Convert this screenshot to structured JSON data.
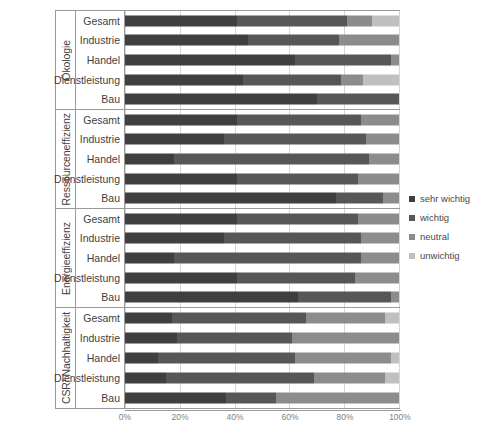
{
  "chart_data": {
    "type": "bar",
    "subtype": "stacked-horizontal-100-percent",
    "title": "",
    "xlabel": "",
    "ylabel": "",
    "xlim": [
      0,
      100
    ],
    "xticks": [
      "0%",
      "20%",
      "40%",
      "60%",
      "80%",
      "100%"
    ],
    "xtick_values": [
      0,
      20,
      40,
      60,
      80,
      100
    ],
    "grid": true,
    "legend_position": "right",
    "categories": [
      "Gesamt",
      "Industrie",
      "Handel",
      "Dienstleistung",
      "Bau"
    ],
    "series": [
      {
        "name": "sehr wichtig",
        "color": "#3f3f3f"
      },
      {
        "name": "wichtig",
        "color": "#575757"
      },
      {
        "name": "neutral",
        "color": "#8c8c8c"
      },
      {
        "name": "unwichtig",
        "color": "#c0c0c0"
      }
    ],
    "groups": [
      {
        "label": "Ökologie",
        "rows": [
          {
            "category": "Gesamt",
            "values": [
              41,
              40,
              9,
              10
            ]
          },
          {
            "category": "Industrie",
            "values": [
              45,
              33,
              22,
              0
            ]
          },
          {
            "category": "Handel",
            "values": [
              62,
              35,
              3,
              0
            ]
          },
          {
            "category": "Dienstleistung",
            "values": [
              43,
              36,
              8,
              13
            ]
          },
          {
            "category": "Bau",
            "values": [
              70,
              30,
              0,
              0
            ]
          }
        ]
      },
      {
        "label": "Ressourceneffizienz",
        "rows": [
          {
            "category": "Gesamt",
            "values": [
              41,
              45,
              14,
              0
            ]
          },
          {
            "category": "Industrie",
            "values": [
              36,
              52,
              12,
              0
            ]
          },
          {
            "category": "Handel",
            "values": [
              18,
              71,
              11,
              0
            ]
          },
          {
            "category": "Dienstleistung",
            "values": [
              41,
              44,
              15,
              0
            ]
          },
          {
            "category": "Bau",
            "values": [
              77,
              17,
              6,
              0
            ]
          }
        ]
      },
      {
        "label": "Energieeffizienz",
        "rows": [
          {
            "category": "Gesamt",
            "values": [
              41,
              44,
              15,
              0
            ]
          },
          {
            "category": "Industrie",
            "values": [
              36,
              50,
              14,
              0
            ]
          },
          {
            "category": "Handel",
            "values": [
              18,
              68,
              14,
              0
            ]
          },
          {
            "category": "Dienstleistung",
            "values": [
              41,
              43,
              16,
              0
            ]
          },
          {
            "category": "Bau",
            "values": [
              63,
              34,
              3,
              0
            ]
          }
        ]
      },
      {
        "label": "CSR/ Nachhaltigkeit",
        "rows": [
          {
            "category": "Gesamt",
            "values": [
              17,
              49,
              29,
              5
            ]
          },
          {
            "category": "Industrie",
            "values": [
              19,
              42,
              39,
              0
            ]
          },
          {
            "category": "Handel",
            "values": [
              12,
              50,
              35,
              3
            ]
          },
          {
            "category": "Dienstleistung",
            "values": [
              15,
              54,
              26,
              5
            ]
          },
          {
            "category": "Bau",
            "values": [
              37,
              18,
              45,
              0
            ]
          }
        ]
      }
    ]
  }
}
